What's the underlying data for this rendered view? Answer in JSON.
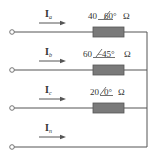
{
  "diagram": {
    "type": "circuit",
    "colors": {
      "wire": "#555555",
      "resistor_fill": "#7a7a7a",
      "resistor_stroke": "#555555",
      "text": "#333333"
    },
    "branches": [
      {
        "current": "I",
        "current_sub": "a",
        "impedance_mag": "40",
        "impedance_angle": "60°",
        "unit": "Ω",
        "wire_y": 32
      },
      {
        "current": "I",
        "current_sub": "b",
        "impedance_mag": "60",
        "impedance_angle": "−45°",
        "unit": "Ω",
        "wire_y": 70
      },
      {
        "current": "I",
        "current_sub": "c",
        "impedance_mag": "20",
        "impedance_angle": "0°",
        "unit": "Ω",
        "wire_y": 108
      },
      {
        "current": "I",
        "current_sub": "n",
        "wire_y": 147
      }
    ]
  }
}
